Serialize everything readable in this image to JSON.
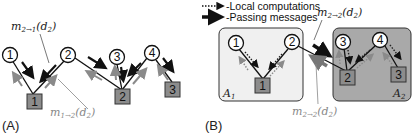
{
  "panels": {
    "a": {
      "label": "(A)"
    },
    "b": {
      "label": "(B)"
    }
  },
  "nodes": {
    "variables": [
      "1",
      "2",
      "3",
      "4"
    ],
    "factors": [
      "1",
      "2",
      "3"
    ]
  },
  "messages": {
    "a_dark": "m",
    "a_dark_sub": "2→1",
    "a_dark_arg": "(d",
    "a_dark_arg_sub": "2",
    "a_dark_close": ")",
    "a_gray": "m",
    "a_gray_sub": "1→2",
    "a_gray_arg": "(d",
    "a_gray_arg_sub": "2",
    "a_gray_close": ")",
    "b_dark": "m",
    "b_dark_sub": "2→2",
    "b_dark_arg": "(d",
    "b_dark_arg_sub": "2",
    "b_dark_close": ")",
    "b_gray": "m",
    "b_gray_sub": "2→2",
    "b_gray_arg": "(d",
    "b_gray_arg_sub": "2",
    "b_gray_close": ")"
  },
  "legend": {
    "local": "-Local computations",
    "passing": "-Passing messages"
  },
  "regions": {
    "a1": "A",
    "a1_sub": "1",
    "a2": "A",
    "a2_sub": "2"
  },
  "colors": {
    "factor_fill": "#8c8c8c",
    "region_a1": "#f0f0f0",
    "region_a2": "#a9a9a9",
    "dark_arrow": "#111111",
    "gray_arrow": "#8a8a8a"
  }
}
